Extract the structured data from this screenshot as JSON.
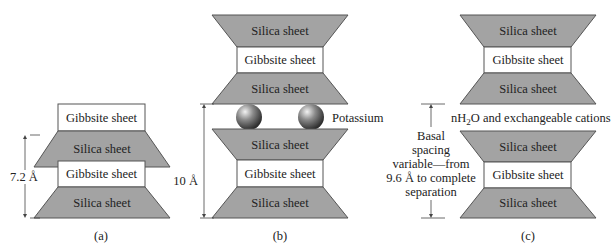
{
  "figure": {
    "colors": {
      "silica_fill": "#a3a3a3",
      "gibbsite_fill": "#ffffff",
      "outline": "#555555",
      "sphere": "#555555"
    },
    "panel_a": {
      "caption": "(a)",
      "layers": [
        "Gibbsite sheet",
        "Silica sheet",
        "Gibbsite sheet",
        "Silica sheet"
      ],
      "spacing_label": "7.2 Å"
    },
    "panel_b": {
      "caption": "(b)",
      "layers_top": [
        "Silica sheet",
        "Gibbsite sheet",
        "Silica sheet"
      ],
      "interlayer_label": "Potassium",
      "layers_bottom": [
        "Silica sheet",
        "Gibbsite sheet",
        "Silica sheet"
      ],
      "spacing_label": "10 Å"
    },
    "panel_c": {
      "caption": "(c)",
      "layers_top": [
        "Silica sheet",
        "Gibbsite sheet",
        "Silica sheet"
      ],
      "interlayer_label_prefix": "nH",
      "interlayer_label_sub": "2",
      "interlayer_label_suffix": "O and exchangeable cations",
      "layers_bottom": [
        "Silica sheet",
        "Gibbsite sheet",
        "Silica sheet"
      ],
      "spacing_label_lines": [
        "Basal",
        "spacing",
        "variable—from",
        "9.6 Å to complete",
        "separation"
      ]
    }
  }
}
